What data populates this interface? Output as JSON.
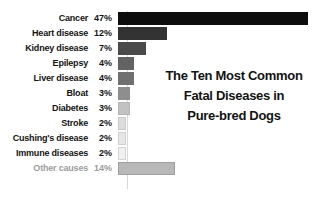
{
  "chart_data": {
    "type": "bar",
    "orientation": "horizontal",
    "title": "The Ten Most Common Fatal Diseases in Pure-bred Dogs",
    "title_lines": [
      "The Ten Most Common",
      "Fatal Diseases in",
      "Pure-bred Dogs"
    ],
    "xlabel": "",
    "ylabel": "",
    "xlim": [
      0,
      47
    ],
    "grid": false,
    "legend": "none",
    "categories": [
      "Cancer",
      "Heart disease",
      "Kidney disease",
      "Epilepsy",
      "Liver disease",
      "Bloat",
      "Diabetes",
      "Stroke",
      "Cushing's disease",
      "Immune diseases",
      "Other causes"
    ],
    "values": [
      47,
      12,
      7,
      4,
      4,
      3,
      3,
      2,
      2,
      2,
      14
    ],
    "value_labels": [
      "47%",
      "12%",
      "7%",
      "4%",
      "4%",
      "3%",
      "3%",
      "2%",
      "2%",
      "2%",
      "14%"
    ],
    "bar_colors": [
      "#0d0d0d",
      "#333333",
      "#4a4a4a",
      "#636363",
      "#707070",
      "#8e8e8e",
      "#c2c2c2",
      "#dcdcdc",
      "#e6e6e6",
      "#f0f0f0",
      "#b8b8b8"
    ],
    "bar_border_colors": [
      "#0d0d0d",
      "#333333",
      "#4a4a4a",
      "#636363",
      "#707070",
      "#8e8e8e",
      "#b5b5b5",
      "#c9c9c9",
      "#cfcfcf",
      "#d4d4d4",
      "#9f9f9f"
    ],
    "label_colors": [
      "#131313",
      "#131313",
      "#131313",
      "#131313",
      "#131313",
      "#131313",
      "#131313",
      "#131313",
      "#131313",
      "#131313",
      "#9c9c9c"
    ],
    "background": "#ffffff",
    "axis_line_color": "#d8d8d8"
  }
}
